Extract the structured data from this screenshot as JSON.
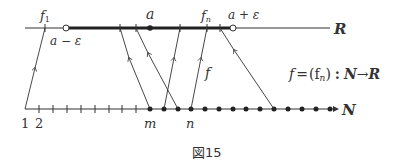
{
  "diagram": {
    "caption": "図15",
    "R_axis": {
      "label": "R",
      "labels": {
        "f1": "f",
        "f1_sub": "1",
        "a": "a",
        "fn": "f",
        "fn_sub": "n",
        "a_minus_eps": "a − ε",
        "a_plus_eps": "a + ε"
      }
    },
    "N_axis": {
      "label": "N",
      "labels": {
        "one": "1",
        "two": "2",
        "m": "m",
        "n": "n"
      }
    },
    "arrow_label": "f",
    "formula": {
      "lhs": "f",
      "eq": "=",
      "seq": "(f",
      "seq_sub": "n",
      "seq_close": ")",
      "colon": ":",
      "domain": "N",
      "arrow": "→",
      "codomain": "R"
    }
  }
}
